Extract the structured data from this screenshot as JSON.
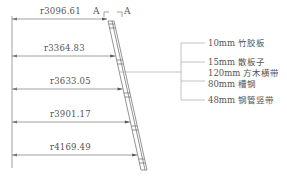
{
  "section_marker": {
    "left": "A",
    "right": "A"
  },
  "dimensions": [
    {
      "label": "r3096.61"
    },
    {
      "label": "r3364.83"
    },
    {
      "label": "r3633.05"
    },
    {
      "label": "r3901.17"
    },
    {
      "label": "r4169.49"
    }
  ],
  "callouts": [
    {
      "label": "10mm 竹胶板"
    },
    {
      "label": "15mm 散板子"
    },
    {
      "label": "120mm 方木横带"
    },
    {
      "label": "80mm 槽钢"
    },
    {
      "label": "48mm 钢管竖带"
    }
  ],
  "colors": {
    "line": "#888888",
    "text": "#555555",
    "background": "#ffffff"
  }
}
